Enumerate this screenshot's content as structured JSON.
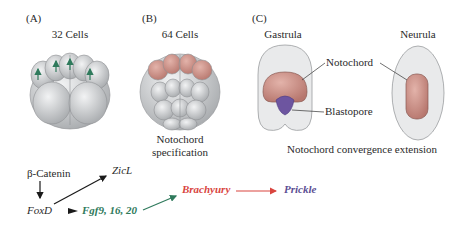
{
  "panels": {
    "a": {
      "label": "(A)",
      "title": "32 Cells"
    },
    "b": {
      "label": "(B)",
      "title": "64 Cells",
      "caption_line1": "Notochord",
      "caption_line2": "specification"
    },
    "c": {
      "label": "(C)",
      "gastrula_title": "Gastrula",
      "neurula_title": "Neurula",
      "notochord_label": "Notochord",
      "blastopore_label": "Blastopore",
      "caption": "Notochord convergence extension"
    }
  },
  "pathway": {
    "beta_catenin": "β-Catenin",
    "foxd": "FoxD",
    "zicl": "ZicL",
    "fgf": "Fgf9, 16, 20",
    "brachyury": "Brachyury",
    "prickle": "Prickle"
  },
  "colors": {
    "cell_gray": "#c9cbcd",
    "notochord_pink": "#c98f86",
    "blastopore_purple": "#6d55a0",
    "fgf_green": "#2f7a5c",
    "brachyury_red": "#d9453f",
    "prickle_purple": "#5b4e93",
    "arrow_black": "#1a1a1a"
  }
}
